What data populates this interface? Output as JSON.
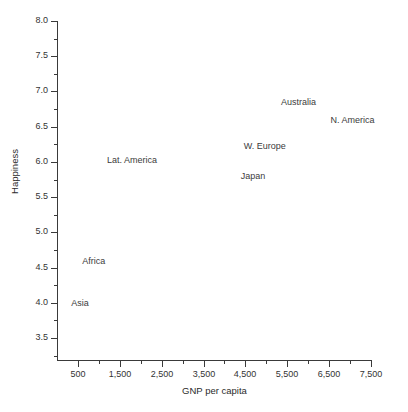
{
  "chart_data": {
    "type": "scatter",
    "title": "",
    "xlabel": "GNP per capita",
    "ylabel": "Happiness",
    "xlim": [
      0,
      7500
    ],
    "ylim": [
      3.25,
      8.0
    ],
    "grid": false,
    "legend": "none",
    "marker": "text-label-only",
    "x_ticks_major": [
      500,
      1500,
      2500,
      3500,
      4500,
      5500,
      6500,
      7500
    ],
    "x_tick_labels": [
      "500",
      "1,500",
      "2,500",
      "3,500",
      "4,500",
      "5,500",
      "6,500",
      "7,500"
    ],
    "x_ticks_minor": [
      1000,
      2000,
      3000,
      4000,
      5000,
      6000,
      7000
    ],
    "y_ticks_major": [
      3.5,
      4.0,
      4.5,
      5.0,
      5.5,
      6.0,
      6.5,
      7.0,
      7.5,
      8.0
    ],
    "y_tick_labels": [
      "3.5",
      "4.0",
      "4.5",
      "5.0",
      "5.5",
      "6.0",
      "6.5",
      "7.0",
      "7.5",
      "8.0"
    ],
    "y_ticks_minor": [
      3.25,
      3.75,
      4.25,
      4.75,
      5.25,
      5.75,
      6.25,
      6.75,
      7.25,
      7.75
    ],
    "points": [
      {
        "label": "Asia",
        "x": 550,
        "y": 4.0
      },
      {
        "label": "Africa",
        "x": 880,
        "y": 4.6
      },
      {
        "label": "Lat. America",
        "x": 1790,
        "y": 6.02
      },
      {
        "label": "Japan",
        "x": 4680,
        "y": 5.8
      },
      {
        "label": "W. Europe",
        "x": 4960,
        "y": 6.23
      },
      {
        "label": "Australia",
        "x": 5770,
        "y": 6.85
      },
      {
        "label": "N. America",
        "x": 7060,
        "y": 6.6
      }
    ]
  },
  "style": {
    "axis_color": "#3a3a3a",
    "text_color": "#333333",
    "background": "#ffffff"
  }
}
